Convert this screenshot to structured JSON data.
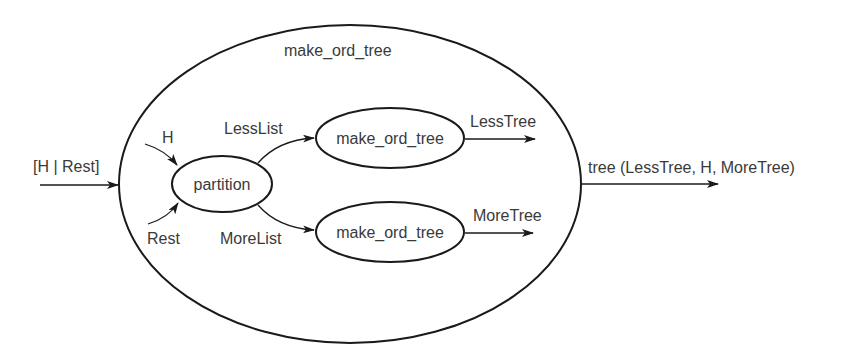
{
  "diagram": {
    "outer_process": {
      "label": "make_ord_tree"
    },
    "input": {
      "label": "[H | Rest]"
    },
    "output": {
      "label": "tree (LessTree, H, MoreTree)"
    },
    "partition": {
      "label": "partition",
      "inputs": [
        {
          "label": "H"
        },
        {
          "label": "Rest"
        }
      ]
    },
    "edges": {
      "less_list": "LessList",
      "more_list": "MoreList",
      "less_tree": "LessTree",
      "more_tree": "MoreTree"
    },
    "sub_processes": [
      {
        "label": "make_ord_tree"
      },
      {
        "label": "make_ord_tree"
      }
    ],
    "colors": {
      "stroke": "#1a1a1a",
      "text": "#3a3a3a",
      "background": "#ffffff"
    }
  }
}
